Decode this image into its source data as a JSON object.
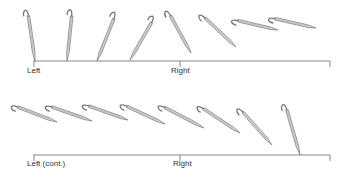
{
  "figure": {
    "colors": {
      "hook_stroke": "#777777",
      "hook_fill": "#d8d8d8",
      "axis": "#888888",
      "text": "#333333"
    },
    "rows": [
      {
        "id": "top",
        "axis": {
          "y": 61,
          "x_start": 34,
          "x_end": 330,
          "tick_x": 180,
          "end_tick_height": 6
        },
        "labels": [
          {
            "text": "Left",
            "x": 27,
            "y": 74
          },
          {
            "text": "Right",
            "x": 171,
            "y": 74
          }
        ],
        "hooks": [
          {
            "head": [
              28,
              13
            ],
            "tip": [
              35,
              61
            ]
          },
          {
            "head": [
              72,
              13
            ],
            "tip": [
              67,
              61
            ]
          },
          {
            "head": [
              115,
              16
            ],
            "tip": [
              97,
              61
            ]
          },
          {
            "head": [
              153,
              20
            ],
            "tip": [
              130,
              60
            ]
          },
          {
            "head": [
              169,
              13
            ],
            "tip": [
              191,
              53
            ]
          },
          {
            "head": [
              203,
              16
            ],
            "tip": [
              236,
              47
            ]
          },
          {
            "head": [
              235,
              20
            ],
            "tip": [
              278,
              30
            ]
          },
          {
            "head": [
              272,
              18
            ],
            "tip": [
              316,
              28
            ]
          }
        ]
      },
      {
        "id": "bottom",
        "axis": {
          "y": 155,
          "x_start": 34,
          "x_end": 330,
          "tick_x": 180,
          "end_tick_height": 6
        },
        "labels": [
          {
            "text": "Left (cont.)",
            "x": 27,
            "y": 167
          },
          {
            "text": "Right",
            "x": 173,
            "y": 167
          }
        ],
        "hooks": [
          {
            "head": [
              15,
              106
            ],
            "tip": [
              57,
              122
            ]
          },
          {
            "head": [
              49,
              106
            ],
            "tip": [
              92,
              121
            ]
          },
          {
            "head": [
              86,
              105
            ],
            "tip": [
              128,
              120
            ]
          },
          {
            "head": [
              124,
              105
            ],
            "tip": [
              165,
              124
            ]
          },
          {
            "head": [
              162,
              106
            ],
            "tip": [
              204,
              128
            ]
          },
          {
            "head": [
              201,
              107
            ],
            "tip": [
              240,
              133
            ]
          },
          {
            "head": [
              241,
              110
            ],
            "tip": [
              272,
              145
            ]
          },
          {
            "head": [
              286,
              107
            ],
            "tip": [
              300,
              155
            ]
          }
        ]
      }
    ]
  }
}
